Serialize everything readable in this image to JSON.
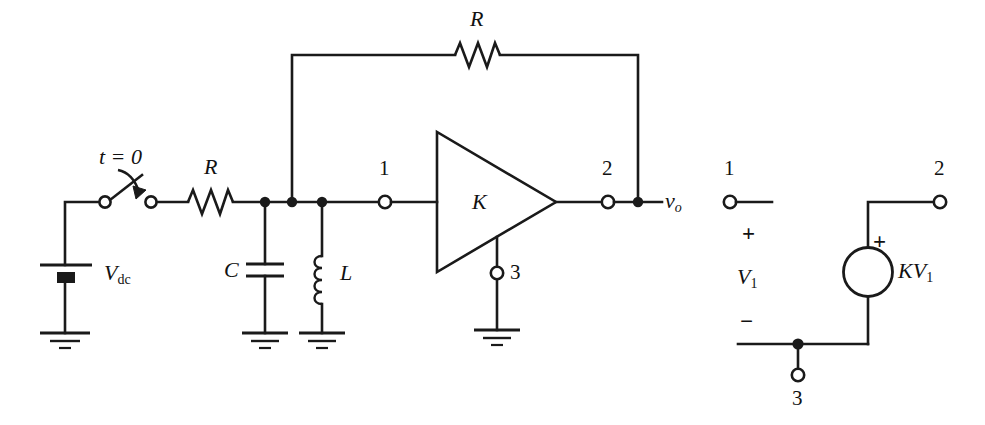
{
  "figure": {
    "type": "electrical-circuit-schematic",
    "background_color": "#ffffff",
    "line_color": "#1a1a1a",
    "left_circuit_title": "",
    "right_circuit_title": ""
  },
  "labels": {
    "switch_time": "t = 0",
    "source_dc": "V",
    "source_dc_sub": "dc",
    "series_resistor": "R",
    "feedback_resistor": "R",
    "capacitor": "C",
    "inductor": "L",
    "amplifier_gain": "K",
    "terminal_1": "1",
    "terminal_2": "2",
    "terminal_3": "3",
    "output_voltage": "v",
    "output_voltage_sub": "o",
    "model_terminal_1": "1",
    "model_terminal_2": "2",
    "model_terminal_3": "3",
    "model_plus_input": "+",
    "model_minus_input": "−",
    "model_input_voltage": "V",
    "model_input_voltage_sub": "1",
    "model_source_plus": "+",
    "model_source_label": "KV",
    "model_source_label_sub": "1"
  },
  "components": {
    "left_network": [
      {
        "name": "dc-voltage-source",
        "label": "Vdc",
        "kind": "battery"
      },
      {
        "name": "switch",
        "label": "t = 0",
        "kind": "spst-switch",
        "state": "open"
      },
      {
        "name": "series-resistor",
        "label": "R",
        "kind": "resistor"
      },
      {
        "name": "shunt-capacitor",
        "label": "C",
        "kind": "capacitor"
      },
      {
        "name": "shunt-inductor",
        "label": "L",
        "kind": "inductor"
      },
      {
        "name": "feedback-resistor",
        "label": "R",
        "kind": "resistor"
      },
      {
        "name": "amplifier",
        "label": "K",
        "kind": "triangle-amplifier"
      },
      {
        "name": "ground-source",
        "kind": "ground"
      },
      {
        "name": "ground-capacitor",
        "kind": "ground"
      },
      {
        "name": "ground-inductor",
        "kind": "ground"
      },
      {
        "name": "ground-amplifier",
        "kind": "ground"
      }
    ],
    "right_model": [
      {
        "name": "input-port",
        "label": "V1",
        "terminals": [
          "1",
          "3"
        ],
        "polarity": [
          "+",
          "−"
        ]
      },
      {
        "name": "dependent-voltage-source",
        "label": "KV1",
        "kind": "vcvs",
        "polarity": "+"
      },
      {
        "name": "output-port",
        "terminals": [
          "2",
          "3"
        ]
      }
    ]
  }
}
